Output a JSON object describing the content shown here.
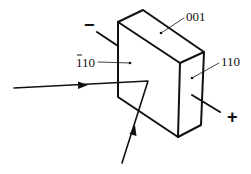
{
  "diagram": {
    "type": "crystal-electro-optic-setup",
    "faces": {
      "top_label": "001",
      "right_label": "110",
      "front_label_digits": "110",
      "front_label_overbar": "1"
    },
    "electrodes": {
      "negative_label": "−",
      "positive_label": "+"
    },
    "colors": {
      "line": "#111111",
      "background": "#ffffff"
    }
  }
}
